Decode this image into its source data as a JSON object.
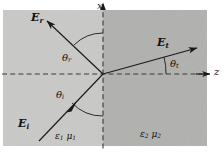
{
  "figure": {
    "canvas": {
      "width": 224,
      "height": 152
    },
    "colors": {
      "medium1_fill": "#c9c9c7",
      "medium2_fill": "#b0b0ae",
      "line": "#1a1a1a",
      "background": "#ffffff"
    },
    "axes": {
      "x_label": "x",
      "z_label": "z",
      "origin": {
        "x": 103,
        "y": 74
      }
    },
    "vectors": [
      {
        "key": "reflected",
        "label": "E",
        "subscript": "r",
        "label_x": 31,
        "label_y": 12,
        "from": {
          "x": 103,
          "y": 74
        },
        "to": {
          "x": 45,
          "y": 19
        }
      },
      {
        "key": "incident",
        "label": "E",
        "subscript": "i",
        "label_x": 18,
        "label_y": 124,
        "from": {
          "x": 39,
          "y": 141
        },
        "to": {
          "x": 103,
          "y": 74
        }
      },
      {
        "key": "transmitted",
        "label": "E",
        "subscript": "t",
        "label_x": 157,
        "label_y": 38,
        "from": {
          "x": 103,
          "y": 74
        },
        "to": {
          "x": 200,
          "y": 47
        }
      }
    ],
    "angles": [
      {
        "key": "theta-r",
        "label": "θ",
        "subscript": "r",
        "label_x": 62,
        "label_y": 56
      },
      {
        "key": "theta-i",
        "label": "θ",
        "subscript": "i",
        "label_x": 56,
        "label_y": 93
      },
      {
        "key": "theta-t",
        "label": "θ",
        "subscript": "t",
        "label_x": 153,
        "label_y": 63
      }
    ],
    "media": [
      {
        "key": "medium-1",
        "epsilon": "ε",
        "epsilon_sub": "1",
        "mu": "μ",
        "mu_sub": "1",
        "label_x": 55,
        "label_y": 136
      },
      {
        "key": "medium-2",
        "epsilon": "ε",
        "epsilon_sub": "2",
        "mu": "μ",
        "mu_sub": "2",
        "label_x": 140,
        "label_y": 134
      }
    ]
  }
}
